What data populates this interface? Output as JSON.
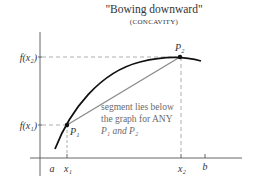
{
  "title": "\"Bowing downward\"",
  "subtitle": "(CONCAVITY)",
  "axes": {
    "y_labels": {
      "f_x2": "f(x₂)",
      "f_x1": "f(x₁)"
    },
    "x_labels": {
      "a": "a",
      "x1": "x₁",
      "x2": "x₂",
      "b": "b"
    }
  },
  "points": {
    "P1": "P₁",
    "P2": "P₂"
  },
  "annotation": {
    "line1": "segment lies below",
    "line2": "the graph for ANY",
    "line3": "P₁ and P₂"
  },
  "colors": {
    "curve": "#111111",
    "secant": "#8c8c8c",
    "axis": "#555555",
    "dashed": "#9a9a9a",
    "text": "#333333",
    "annotation": "#6a6a6a"
  }
}
